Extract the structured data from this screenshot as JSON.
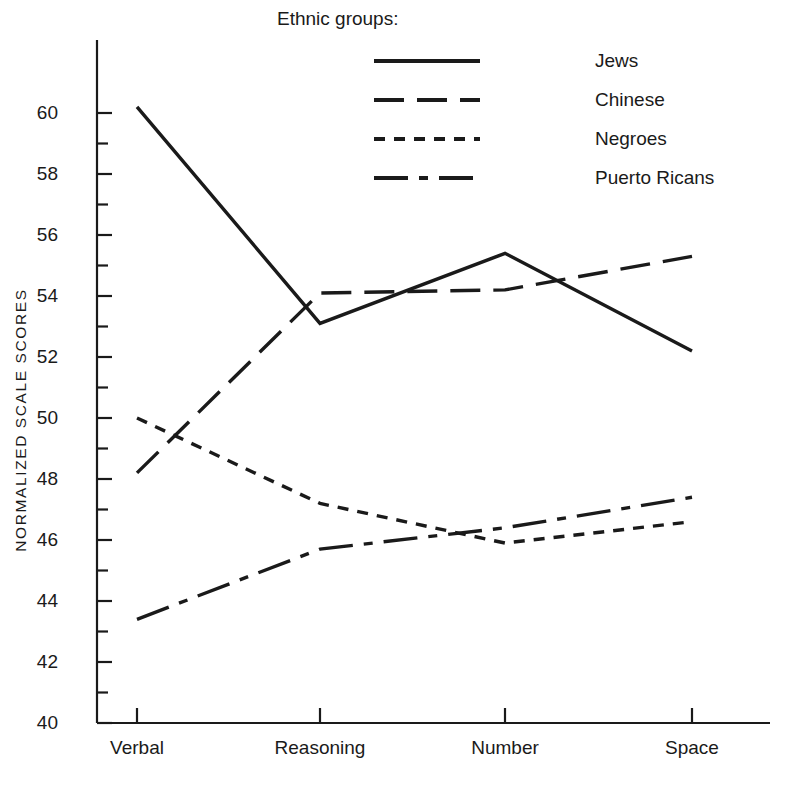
{
  "chart_data": {
    "type": "line",
    "title": "",
    "xlabel": "",
    "ylabel": "NORMALIZED SCALE SCORES",
    "categories": [
      "Verbal",
      "Reasoning",
      "Number",
      "Space"
    ],
    "ylim": [
      40,
      60
    ],
    "ytick_step": 2,
    "minor_tick_step": 1,
    "grid": false,
    "yticks": [
      "40",
      "42",
      "44",
      "46",
      "48",
      "50",
      "52",
      "54",
      "56",
      "58",
      "60"
    ],
    "legend_title": "Ethnic groups:",
    "legend_position": "top-right-inside",
    "line_color": "#1a1a1a",
    "series": [
      {
        "name": "Jews",
        "dash": "solid",
        "values": [
          60.2,
          53.1,
          55.4,
          52.2
        ]
      },
      {
        "name": "Chinese",
        "dash": "long-dash",
        "values": [
          48.2,
          54.1,
          54.2,
          55.3
        ]
      },
      {
        "name": "Negroes",
        "dash": "short-dash",
        "values": [
          50.0,
          47.2,
          45.9,
          46.6
        ]
      },
      {
        "name": "Puerto Ricans",
        "dash": "dash-dot",
        "values": [
          43.4,
          45.7,
          46.4,
          47.4
        ]
      }
    ]
  }
}
